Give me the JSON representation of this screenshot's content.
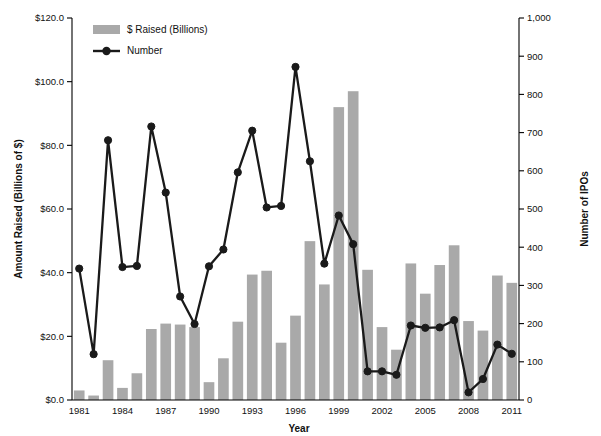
{
  "chart_data": {
    "type": "bar",
    "title": "",
    "xlabel": "Year",
    "ylabel": "Amount Raised (Billions of $)",
    "y2label": "Number of IPOs",
    "grid": false,
    "legend_position": "top-left",
    "ylim": [
      0,
      120
    ],
    "y2lim": [
      0,
      1000
    ],
    "y_ticks": [
      0,
      20,
      40,
      60,
      80,
      100,
      120
    ],
    "y_tick_labels": [
      "$0.0",
      "$20.0",
      "$40.0",
      "$60.0",
      "$80.0",
      "$100.0",
      "$120.0"
    ],
    "y2_ticks": [
      0,
      100,
      200,
      300,
      400,
      500,
      600,
      700,
      800,
      900,
      1000
    ],
    "y2_tick_labels": [
      "0",
      "100",
      "200",
      "300",
      "400",
      "500",
      "600",
      "700",
      "800",
      "900",
      "1,000"
    ],
    "categories": [
      1981,
      1982,
      1983,
      1984,
      1985,
      1986,
      1987,
      1988,
      1989,
      1990,
      1991,
      1992,
      1993,
      1994,
      1995,
      1996,
      1997,
      1998,
      1999,
      2000,
      2001,
      2002,
      2003,
      2004,
      2005,
      2006,
      2007,
      2008,
      2009,
      2010,
      2011
    ],
    "x_tick_labels": [
      "1981",
      "1984",
      "1987",
      "1990",
      "1993",
      "1996",
      "1999",
      "2002",
      "2005",
      "2008",
      "2011"
    ],
    "x_tick_years": [
      1981,
      1984,
      1987,
      1990,
      1993,
      1996,
      1999,
      2002,
      2005,
      2008,
      2011
    ],
    "series": [
      {
        "name": "$ Raised (Billions)",
        "kind": "bar",
        "axis": "left",
        "unit": "Billions of $",
        "color": "#a9a9a9",
        "values": [
          3.0,
          1.4,
          12.5,
          3.8,
          8.4,
          22.3,
          24.0,
          23.7,
          22.9,
          5.6,
          13.1,
          24.6,
          39.4,
          40.6,
          18.0,
          26.5,
          49.9,
          36.3,
          92.0,
          97.0,
          40.9,
          22.9,
          15.8,
          42.9,
          33.4,
          42.4,
          48.6,
          24.8,
          21.8,
          39.1,
          36.8
        ]
      },
      {
        "name": "Number",
        "kind": "line",
        "axis": "right",
        "unit": "Number of IPOs",
        "color": "#1a1a1a",
        "values": [
          344,
          120,
          680,
          348,
          351,
          716,
          543,
          271,
          199,
          350,
          394,
          596,
          705,
          504,
          508,
          872,
          625,
          357,
          483,
          408,
          75,
          75,
          66,
          195,
          189,
          190,
          209,
          20,
          55,
          145,
          121
        ]
      }
    ]
  },
  "legend": {
    "items": [
      {
        "label": "$ Raised (Billions)",
        "marker": "bar-swatch"
      },
      {
        "label": "Number",
        "marker": "line-marker"
      }
    ]
  },
  "axes": {
    "left_title": "Amount Raised (Billions of $)",
    "right_title": "Number of IPOs",
    "bottom_title": "Year"
  }
}
